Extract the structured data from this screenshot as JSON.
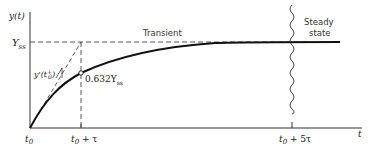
{
  "diagram": {
    "type": "first-order step response",
    "y_axis_label": "y(t)",
    "x_axis_label": "t",
    "steady_level_label": "Y",
    "steady_level_sub": "ss",
    "tangent_label": "y'(t",
    "tangent_label_sub": "0",
    "tangent_label_sup": "+",
    "tangent_label_close": ")",
    "point_label": "0.632Y",
    "point_label_sub": "ss",
    "x_ticks": {
      "t0": {
        "main": "t",
        "sub": "0"
      },
      "t0_tau": {
        "main": "t",
        "sub": "0",
        "rest": " + τ"
      },
      "t0_5tau": {
        "main": "t",
        "sub": "0",
        "rest": " + 5τ"
      }
    },
    "regions": {
      "transient": "Transient",
      "steady_line1": "Steady",
      "steady_line2": "state"
    },
    "colors": {
      "curve": "#111111",
      "axis": "#333333",
      "dashed": "#444444"
    }
  }
}
